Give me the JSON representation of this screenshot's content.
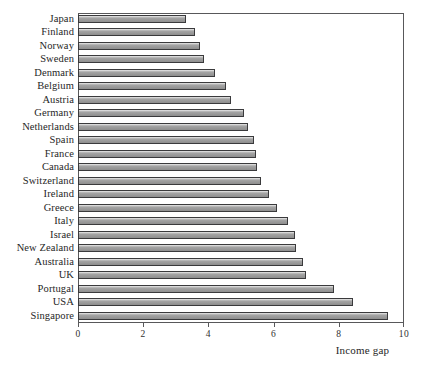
{
  "chart_data": {
    "type": "bar",
    "orientation": "horizontal",
    "title": "",
    "xlabel": "Income gap",
    "ylabel": "",
    "xlim": [
      0,
      10
    ],
    "xticks": [
      0,
      2,
      4,
      6,
      8,
      10
    ],
    "xticklabels": [
      "0",
      "2",
      "4",
      "6",
      "8",
      "10"
    ],
    "grid": false,
    "legend": null,
    "categories": [
      "Japan",
      "Finland",
      "Norway",
      "Sweden",
      "Denmark",
      "Belgium",
      "Austria",
      "Germany",
      "Netherlands",
      "Spain",
      "France",
      "Canada",
      "Switzerland",
      "Ireland",
      "Greece",
      "Italy",
      "Israel",
      "New Zealand",
      "Australia",
      "UK",
      "Portugal",
      "USA",
      "Singapore"
    ],
    "values": [
      3.3,
      3.6,
      3.75,
      3.85,
      4.2,
      4.55,
      4.7,
      5.1,
      5.2,
      5.4,
      5.45,
      5.5,
      5.6,
      5.85,
      6.1,
      6.45,
      6.65,
      6.7,
      6.9,
      7.0,
      7.85,
      8.45,
      9.5
    ],
    "colors": {
      "bar_fill": "#9b9b9b",
      "bar_edge": "#3a3a3c",
      "axis": "#58585a",
      "text": "#262626",
      "background": "#ffffff"
    }
  }
}
